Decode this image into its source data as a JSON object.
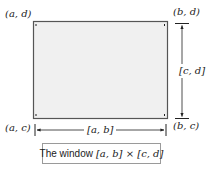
{
  "diagram": {
    "type": "window-rectangle",
    "window": {
      "fill": "#f0f0f0",
      "border": "#555555"
    },
    "corners": {
      "top_left": "(a, d)",
      "top_right": "(b, d)",
      "bottom_left": "(a, c)",
      "bottom_right": "(b, c)"
    },
    "dimensions": {
      "horizontal": "[a, b]",
      "vertical": "[c, d]"
    },
    "caption": {
      "prefix": "The window",
      "math": "[a, b] × [c, d]"
    }
  }
}
